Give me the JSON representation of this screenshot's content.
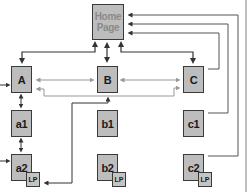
{
  "diagram": {
    "type": "site-map hierarchy",
    "home": {
      "label_line1": "Home",
      "label_line2": "Page"
    },
    "level1": [
      {
        "id": "A",
        "label": "A"
      },
      {
        "id": "B",
        "label": "B"
      },
      {
        "id": "C",
        "label": "C"
      }
    ],
    "level2": [
      {
        "id": "a1",
        "label": "a1"
      },
      {
        "id": "b1",
        "label": "b1"
      },
      {
        "id": "c1",
        "label": "c1"
      }
    ],
    "level3": [
      {
        "id": "a2",
        "label": "a2",
        "badge": "LP"
      },
      {
        "id": "b2",
        "label": "b2",
        "badge": "LP"
      },
      {
        "id": "c2",
        "label": "c2",
        "badge": "LP"
      }
    ],
    "connections": [
      {
        "from": "Home",
        "to": "A",
        "style": "bidirectional"
      },
      {
        "from": "Home",
        "to": "B",
        "style": "bidirectional"
      },
      {
        "from": "Home",
        "to": "C",
        "style": "bidirectional"
      },
      {
        "from": "A",
        "to": "B",
        "style": "bidirectional-light"
      },
      {
        "from": "B",
        "to": "C",
        "style": "bidirectional-light"
      },
      {
        "from": "A",
        "to": "C",
        "style": "bidirectional-light"
      },
      {
        "from": "A",
        "to": "a1",
        "style": "bidirectional"
      },
      {
        "from": "a1",
        "to": "a2",
        "style": "bidirectional"
      },
      {
        "from": "C",
        "to": "Home",
        "style": "arrow"
      },
      {
        "from": "c1",
        "to": "Home",
        "style": "arrow"
      },
      {
        "from": "c2",
        "to": "Home",
        "style": "arrow"
      },
      {
        "from": "a2-LP",
        "to": "B",
        "style": "arrow"
      }
    ],
    "colors": {
      "box_fill": "#bdbdbd",
      "box_border": "#3a3a3a",
      "line_dark": "#333333",
      "line_light": "#9a9a9a",
      "home_text": "#8a8a8a"
    }
  }
}
